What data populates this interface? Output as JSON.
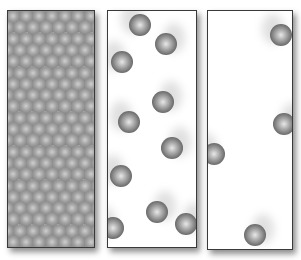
{
  "figure": {
    "panels": [
      {
        "id": "solid",
        "label": "",
        "arrangement": "hexagonal close packed lattice"
      },
      {
        "id": "liquid",
        "label": "",
        "particles": [
          [
            32,
            14
          ],
          [
            58,
            33
          ],
          [
            14,
            51
          ],
          [
            55,
            91
          ],
          [
            21,
            111
          ],
          [
            64,
            137
          ],
          [
            13,
            165
          ],
          [
            49,
            201
          ],
          [
            5,
            217
          ],
          [
            78,
            213
          ]
        ]
      },
      {
        "id": "gas",
        "label": "",
        "particles": [
          [
            73,
            24
          ],
          [
            76,
            113
          ],
          [
            6,
            143
          ],
          [
            47,
            224
          ]
        ]
      }
    ],
    "colors": {
      "sphere_dark": "#3c3c3c",
      "sphere_light": "#e8e8e8",
      "border": "#3a3a3a",
      "background": "#ffffff"
    }
  }
}
